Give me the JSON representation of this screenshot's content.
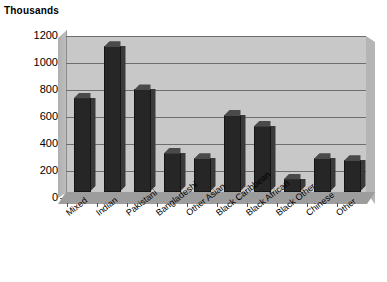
{
  "chart_data": {
    "type": "bar",
    "title": "Thousands",
    "xlabel": "",
    "ylabel": "Thousands",
    "ylim": [
      0,
      1200
    ],
    "ytick_step": 200,
    "grid": true,
    "legend": "none",
    "style": "3d-column",
    "bar_color": "#262626",
    "plot_bg_color": "#c8c8c8",
    "categories": [
      "Mixed",
      "Indian",
      "Pakistani",
      "Bangladeshi",
      "Other Asian",
      "Black Caribbean",
      "Black African",
      "Black Other",
      "Chinese",
      "Other"
    ],
    "values": [
      700,
      1080,
      760,
      290,
      250,
      570,
      490,
      100,
      250,
      235
    ],
    "ytick_labels": [
      "0",
      "200",
      "400",
      "600",
      "800",
      "1000",
      "1200"
    ]
  }
}
